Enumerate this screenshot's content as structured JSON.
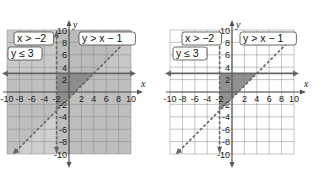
{
  "graphs": [
    {
      "id": "left",
      "description": "System of inequalities with all three half-planes shaded",
      "origin_px": [
        69,
        92
      ],
      "unit_px": 6.2,
      "range": [
        -10,
        10
      ],
      "x_tick_labels": [
        "-10",
        "-8",
        "-6",
        "-4",
        "-2",
        "2",
        "4",
        "6",
        "8",
        "10"
      ],
      "y_tick_labels": [
        "10",
        "8",
        "6",
        "4",
        "2",
        "-2",
        "-4",
        "-6",
        "-8",
        "-10"
      ],
      "x_axis_label": "x",
      "y_axis_label": "y",
      "inequalities": [
        {
          "label": "x > −2",
          "pos_px": [
            14,
            32
          ]
        },
        {
          "label": "y > x − 1",
          "pos_px": [
            79,
            32
          ]
        },
        {
          "label": "y ≤ 3",
          "pos_px": [
            8,
            47
          ]
        }
      ],
      "shade_all_regions": true
    },
    {
      "id": "right",
      "description": "System of inequalities with only the solution region shaded",
      "origin_px": [
        232,
        92
      ],
      "unit_px": 6.2,
      "range": [
        -10,
        10
      ],
      "x_tick_labels": [
        "-10",
        "-8",
        "-6",
        "-4",
        "-2",
        "2",
        "4",
        "6",
        "8",
        "10"
      ],
      "y_tick_labels": [
        "10",
        "8",
        "6",
        "4",
        "2",
        "-2",
        "-4",
        "-6",
        "-8",
        "-10"
      ],
      "x_axis_label": "x",
      "y_axis_label": "y",
      "inequalities": [
        {
          "label": "x > −2",
          "pos_px": [
            182,
            32
          ]
        },
        {
          "label": "y > x − 1",
          "pos_px": [
            240,
            32
          ]
        },
        {
          "label": "y ≤ 3",
          "pos_px": [
            173,
            47
          ]
        }
      ],
      "shade_all_regions": false
    }
  ],
  "boundaries": [
    {
      "name": "x = -2",
      "style": "dashed",
      "type": "vertical",
      "x": -2
    },
    {
      "name": "y = 3",
      "style": "solid",
      "type": "horizontal",
      "y": 3
    },
    {
      "name": "y = x - 1",
      "style": "dashed",
      "type": "line",
      "slope": 1,
      "intercept": -1
    }
  ],
  "solution_region_vertices": [
    [
      -2,
      3
    ],
    [
      -2,
      -3
    ],
    [
      4,
      3
    ]
  ],
  "colors": {
    "grid_bg": "#e2e2e2",
    "grid_line": "#8a8a8a",
    "shade_light": "#cfcfcf",
    "shade_mid": "#b0b0b0",
    "shade_dark": "#8c8c8c",
    "solution": "#7e7e7e",
    "axis": "#555555",
    "boundary": "#666666"
  }
}
